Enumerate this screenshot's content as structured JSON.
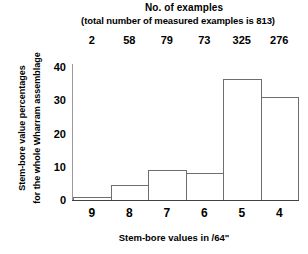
{
  "header": {
    "title": "No. of examples",
    "subtitle": "(total number of measured examples is 813)"
  },
  "axes": {
    "ylabel_line1": "Stem-bore value percentages",
    "ylabel_line2": "for the whole Wharram assemblage",
    "xlabel": "Stem-bore values in /64\"",
    "yticks": [
      "0",
      "10",
      "20",
      "30",
      "40"
    ]
  },
  "chart_data": {
    "type": "bar",
    "title": "No. of examples",
    "subtitle": "(total number of measured examples is 813)",
    "xlabel": "Stem-bore values in /64\"",
    "ylabel": "Stem-bore value percentages for the whole Wharram assemblage",
    "categories": [
      "9",
      "8",
      "7",
      "6",
      "5",
      "4"
    ],
    "values": [
      1,
      5,
      10,
      9,
      40,
      34
    ],
    "counts": [
      2,
      58,
      79,
      73,
      325,
      276
    ],
    "total_count": 813,
    "ylim": [
      0,
      44
    ],
    "yticks": [
      0,
      10,
      20,
      30,
      40
    ],
    "grid": false,
    "legend": false,
    "bar_fill": "#ffffff",
    "bar_edge": "#6e6e6e"
  }
}
